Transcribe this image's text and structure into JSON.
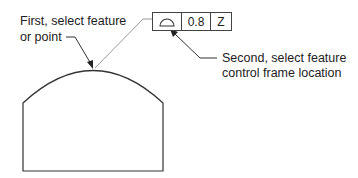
{
  "callouts": {
    "first": {
      "line1": "First, select feature",
      "line2": "or point"
    },
    "second": {
      "line1": "Second, select feature",
      "line2": "control frame location"
    }
  },
  "feature_control_frame": {
    "symbol_icon": "profile-of-surface-icon",
    "tolerance": "0.8",
    "datum": "Z"
  },
  "colors": {
    "line": "#333333",
    "leader_gray": "#999999"
  }
}
